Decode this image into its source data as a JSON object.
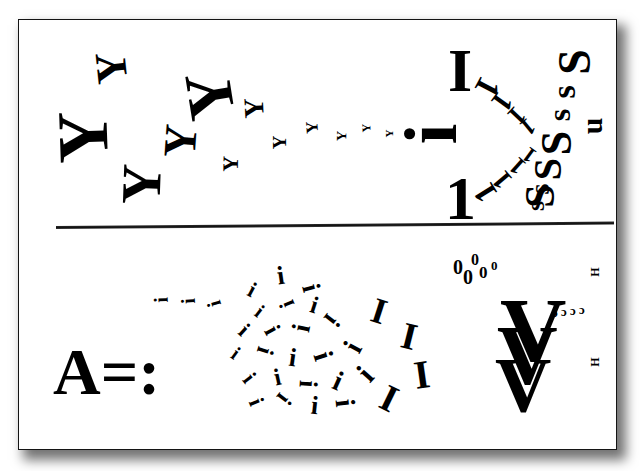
{
  "canvas": {
    "width": 640,
    "height": 471,
    "background": "#ffffff"
  },
  "sheet": {
    "x": 18,
    "y": 19,
    "width": 599,
    "height": 431,
    "background": "#ffffff",
    "border_color": "#141414",
    "shadow_color": "rgba(0,0,0,0.55)"
  },
  "divider": {
    "x": 37,
    "y": 206,
    "width": 558,
    "height": 3,
    "rotation_deg": -0.45,
    "color": "#151515"
  },
  "ink_color": "#000000",
  "panels": [
    {
      "name": "upper-panel",
      "groups": [
        {
          "name": "y-swarm",
          "glyph": "Y",
          "description": "Y letterforms rotated toward the left, shrinking left-to-right",
          "items": [
            {
              "char": "Y",
              "x": 95,
              "y": 45,
              "size": 44,
              "rot": -96
            },
            {
              "char": "Y",
              "x": 56,
              "y": 100,
              "size": 72,
              "rot": -92
            },
            {
              "char": "Y",
              "x": 120,
              "y": 155,
              "size": 56,
              "rot": -88
            },
            {
              "char": "Y",
              "x": 185,
              "y": 62,
              "size": 66,
              "rot": -99
            },
            {
              "char": "Y",
              "x": 163,
              "y": 117,
              "size": 46,
              "rot": -86
            },
            {
              "char": "Y",
              "x": 243,
              "y": 93,
              "size": 28,
              "rot": -93
            },
            {
              "char": "Y",
              "x": 222,
              "y": 152,
              "size": 22,
              "rot": -89
            },
            {
              "char": "Y",
              "x": 272,
              "y": 132,
              "size": 19,
              "rot": -90
            },
            {
              "char": "Y",
              "x": 305,
              "y": 118,
              "size": 17,
              "rot": -94
            },
            {
              "char": "Y",
              "x": 336,
              "y": 128,
              "size": 14,
              "rot": -88
            },
            {
              "char": "Y",
              "x": 361,
              "y": 121,
              "size": 12,
              "rot": -92
            },
            {
              "char": "Y",
              "x": 385,
              "y": 127,
              "size": 11,
              "rot": -90
            }
          ]
        },
        {
          "name": "i-axis-center",
          "glyph": "i",
          "description": "Large I, dotted i rotated, numeral 1 forming a vertical axis",
          "items": [
            {
              "char": "I",
              "x": 447,
              "y": 38,
              "size": 62,
              "rot": 0
            },
            {
              "char": "i",
              "x": 420,
              "y": 96,
              "size": 74,
              "rot": -90
            },
            {
              "char": "1",
              "x": 444,
              "y": 166,
              "size": 62,
              "rot": 0
            }
          ]
        },
        {
          "name": "one-arc-upper",
          "glyph": "1",
          "description": "Numeral 1 glyphs sweeping in an upper arc",
          "items": [
            {
              "char": "1",
              "x": 478,
              "y": 69,
              "size": 34,
              "rot": 118
            },
            {
              "char": "1",
              "x": 494,
              "y": 86,
              "size": 30,
              "rot": 126
            },
            {
              "char": "1",
              "x": 509,
              "y": 101,
              "size": 27,
              "rot": 133
            },
            {
              "char": "1",
              "x": 521,
              "y": 114,
              "size": 24,
              "rot": 141
            }
          ]
        },
        {
          "name": "one-arc-lower",
          "glyph": "1",
          "description": "Numeral 1 glyphs sweeping in a lower arc",
          "items": [
            {
              "char": "1",
              "x": 476,
              "y": 176,
              "size": 32,
              "rot": -122
            },
            {
              "char": "1",
              "x": 494,
              "y": 165,
              "size": 28,
              "rot": -130
            },
            {
              "char": "1",
              "x": 510,
              "y": 153,
              "size": 25,
              "rot": -138
            },
            {
              "char": "1",
              "x": 523,
              "y": 143,
              "size": 22,
              "rot": -144
            }
          ]
        },
        {
          "name": "s-column",
          "glyph": "S",
          "description": "S and s letters stacked vertically, rotated ~90 degrees",
          "items": [
            {
              "char": "S",
              "x": 561,
              "y": 38,
              "size": 46,
              "rot": -90
            },
            {
              "char": "s",
              "x": 556,
              "y": 74,
              "size": 34,
              "rot": -90
            },
            {
              "char": "s",
              "x": 552,
              "y": 98,
              "size": 32,
              "rot": -90
            },
            {
              "char": "S",
              "x": 544,
              "y": 120,
              "size": 44,
              "rot": -90
            },
            {
              "char": "S",
              "x": 536,
              "y": 148,
              "size": 40,
              "rot": -90
            },
            {
              "char": "s",
              "x": 534,
              "y": 174,
              "size": 28,
              "rot": -90
            },
            {
              "char": "s",
              "x": 530,
              "y": 192,
              "size": 26,
              "rot": -90
            },
            {
              "char": "S",
              "x": 527,
              "y": 174,
              "size": 42,
              "rot": -90
            }
          ]
        },
        {
          "name": "u-mark",
          "glyph": "u",
          "description": "small u rotated 90 degrees beside the S column",
          "items": [
            {
              "char": "u",
              "x": 583,
              "y": 110,
              "size": 30,
              "rot": -90
            }
          ]
        }
      ]
    },
    {
      "name": "lower-panel",
      "groups": [
        {
          "name": "a-equals-colon",
          "glyph": "A=:",
          "description": "Bold serif A followed by equals sign and colon",
          "items": [
            {
              "char": "A=:",
              "x": 52,
              "y": 338,
              "size": 66,
              "rot": 0
            }
          ]
        },
        {
          "name": "i-trail",
          "glyph": "i",
          "description": "i glyphs rotated sideways forming an incoming trail",
          "items": [
            {
              "char": "i",
              "x": 157,
              "y": 289,
              "size": 20,
              "rot": -92
            },
            {
              "char": "i",
              "x": 184,
              "y": 290,
              "size": 20,
              "rot": -93
            },
            {
              "char": "i",
              "x": 210,
              "y": 293,
              "size": 20,
              "rot": -107
            }
          ]
        },
        {
          "name": "i-scatter",
          "glyph": "i",
          "description": "Randomly rotated i / I glyphs, growing larger toward the right",
          "items": [
            {
              "char": "i",
              "x": 248,
              "y": 278,
              "size": 22,
              "rot": 28
            },
            {
              "char": "i",
              "x": 276,
              "y": 262,
              "size": 26,
              "rot": -8
            },
            {
              "char": "i",
              "x": 306,
              "y": 274,
              "size": 26,
              "rot": 75
            },
            {
              "char": "i",
              "x": 256,
              "y": 300,
              "size": 20,
              "rot": 38
            },
            {
              "char": "i",
              "x": 283,
              "y": 292,
              "size": 22,
              "rot": -112
            },
            {
              "char": "i",
              "x": 310,
              "y": 292,
              "size": 24,
              "rot": 18
            },
            {
              "char": "i",
              "x": 240,
              "y": 318,
              "size": 22,
              "rot": 42
            },
            {
              "char": "i",
              "x": 268,
              "y": 317,
              "size": 24,
              "rot": 62
            },
            {
              "char": "i",
              "x": 297,
              "y": 314,
              "size": 26,
              "rot": -78
            },
            {
              "char": "i",
              "x": 327,
              "y": 306,
              "size": 26,
              "rot": 128
            },
            {
              "char": "i",
              "x": 232,
              "y": 342,
              "size": 20,
              "rot": 36
            },
            {
              "char": "i",
              "x": 261,
              "y": 338,
              "size": 24,
              "rot": 108
            },
            {
              "char": "i",
              "x": 288,
              "y": 344,
              "size": 26,
              "rot": 8
            },
            {
              "char": "i",
              "x": 318,
              "y": 341,
              "size": 28,
              "rot": 72
            },
            {
              "char": "i",
              "x": 348,
              "y": 332,
              "size": 28,
              "rot": -62
            },
            {
              "char": "i",
              "x": 245,
              "y": 366,
              "size": 22,
              "rot": 52
            },
            {
              "char": "i",
              "x": 273,
              "y": 364,
              "size": 24,
              "rot": -12
            },
            {
              "char": "i",
              "x": 303,
              "y": 370,
              "size": 26,
              "rot": 94
            },
            {
              "char": "i",
              "x": 333,
              "y": 366,
              "size": 28,
              "rot": 24
            },
            {
              "char": "i",
              "x": 360,
              "y": 358,
              "size": 30,
              "rot": -48
            },
            {
              "char": "i",
              "x": 252,
              "y": 390,
              "size": 22,
              "rot": 68
            },
            {
              "char": "i",
              "x": 280,
              "y": 386,
              "size": 24,
              "rot": 128
            },
            {
              "char": "i",
              "x": 310,
              "y": 392,
              "size": 26,
              "rot": 6
            },
            {
              "char": "i",
              "x": 340,
              "y": 388,
              "size": 28,
              "rot": 84
            },
            {
              "char": "I",
              "x": 371,
              "y": 292,
              "size": 36,
              "rot": 18
            },
            {
              "char": "I",
              "x": 401,
              "y": 316,
              "size": 38,
              "rot": 14
            },
            {
              "char": "I",
              "x": 381,
              "y": 378,
              "size": 38,
              "rot": 26
            },
            {
              "char": "I",
              "x": 413,
              "y": 354,
              "size": 40,
              "rot": -8
            }
          ]
        },
        {
          "name": "zero-cluster",
          "glyph": "0",
          "description": "Cluster of five small zeros",
          "items": [
            {
              "char": "0",
              "x": 452,
              "y": 256,
              "size": 20,
              "rot": 0
            },
            {
              "char": "0",
              "x": 470,
              "y": 251,
              "size": 16,
              "rot": 0
            },
            {
              "char": "0",
              "x": 462,
              "y": 266,
              "size": 20,
              "rot": 0
            },
            {
              "char": "0",
              "x": 478,
              "y": 263,
              "size": 17,
              "rot": 0
            },
            {
              "char": "0",
              "x": 490,
              "y": 258,
              "size": 13,
              "rot": 0
            }
          ]
        },
        {
          "name": "v-stack",
          "glyph": "V",
          "description": "Three nested bold V glyphs descending",
          "items": [
            {
              "char": "V",
              "x": 499,
              "y": 283,
              "size": 92,
              "rot": 0
            },
            {
              "char": "V",
              "x": 496,
              "y": 313,
              "size": 84,
              "rot": 0
            },
            {
              "char": "V",
              "x": 494,
              "y": 345,
              "size": 78,
              "rot": 0
            }
          ]
        },
        {
          "name": "c-row",
          "glyph": "c",
          "description": "Row of four tiny c letters rotated",
          "items": [
            {
              "char": "c",
              "x": 551,
              "y": 308,
              "size": 13,
              "rot": 180
            },
            {
              "char": "c",
              "x": 560,
              "y": 307,
              "size": 13,
              "rot": 180
            },
            {
              "char": "c",
              "x": 569,
              "y": 306,
              "size": 13,
              "rot": 180
            },
            {
              "char": "c",
              "x": 578,
              "y": 305,
              "size": 13,
              "rot": 180
            }
          ]
        },
        {
          "name": "h-marks",
          "glyph": "H",
          "description": "Two tiny rotated H letters at the right margin",
          "items": [
            {
              "char": "H",
              "x": 589,
              "y": 265,
              "size": 12,
              "rot": -90
            },
            {
              "char": "H",
              "x": 589,
              "y": 355,
              "size": 12,
              "rot": -90
            }
          ]
        }
      ]
    }
  ]
}
